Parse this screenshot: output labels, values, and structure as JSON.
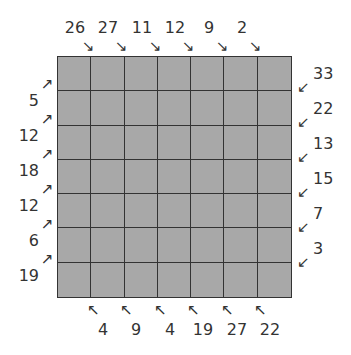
{
  "puzzle": {
    "rows": 7,
    "cols": 7,
    "colors": {
      "cell": "#a8a8a8",
      "line": "#333333",
      "text": "#333333",
      "background": "#ffffff"
    },
    "top_clues": [
      {
        "value": "26",
        "arrow": "↘"
      },
      {
        "value": "27",
        "arrow": "↘"
      },
      {
        "value": "11",
        "arrow": "↘"
      },
      {
        "value": "12",
        "arrow": "↘"
      },
      {
        "value": "9",
        "arrow": "↘"
      },
      {
        "value": "2",
        "arrow": "↘"
      }
    ],
    "left_clues": [
      {
        "value": "5",
        "arrow": "↗"
      },
      {
        "value": "12",
        "arrow": "↗"
      },
      {
        "value": "18",
        "arrow": "↗"
      },
      {
        "value": "12",
        "arrow": "↗"
      },
      {
        "value": "6",
        "arrow": "↗"
      },
      {
        "value": "19",
        "arrow": "↗"
      }
    ],
    "right_clues": [
      {
        "value": "33",
        "arrow": "↙"
      },
      {
        "value": "22",
        "arrow": "↙"
      },
      {
        "value": "13",
        "arrow": "↙"
      },
      {
        "value": "15",
        "arrow": "↙"
      },
      {
        "value": "7",
        "arrow": "↙"
      },
      {
        "value": "3",
        "arrow": "↙"
      }
    ],
    "bottom_clues": [
      {
        "value": "4",
        "arrow": "↖"
      },
      {
        "value": "9",
        "arrow": "↖"
      },
      {
        "value": "4",
        "arrow": "↖"
      },
      {
        "value": "19",
        "arrow": "↖"
      },
      {
        "value": "27",
        "arrow": "↖"
      },
      {
        "value": "22",
        "arrow": "↖"
      }
    ]
  }
}
